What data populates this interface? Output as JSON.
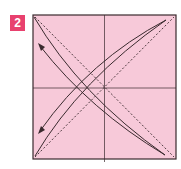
{
  "step": {
    "number": "2",
    "badge_color": "#e8416e"
  },
  "diagram": {
    "paper_color": "#f7c9d9",
    "line_color": "#3a2a2e"
  }
}
